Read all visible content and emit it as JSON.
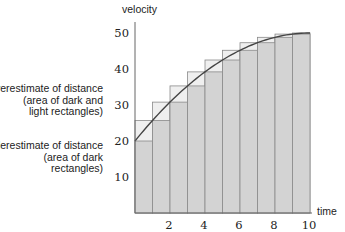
{
  "chart_data": {
    "type": "bar",
    "subtype": "riemann-sum",
    "title": "",
    "xlabel": "time",
    "ylabel": "velocity",
    "xlim": [
      0,
      10
    ],
    "ylim": [
      0,
      52
    ],
    "x_ticks": [
      2,
      4,
      6,
      8,
      10
    ],
    "y_ticks": [
      10,
      20,
      30,
      40,
      50
    ],
    "grid": false,
    "categories": [
      "0-1",
      "1-2",
      "2-3",
      "3-4",
      "4-5",
      "5-6",
      "6-7",
      "7-8",
      "8-9",
      "9-10"
    ],
    "series": [
      {
        "name": "Underestimate (dark rectangles, left endpoints)",
        "values": [
          20,
          25.7,
          30.8,
          35.3,
          39.2,
          42.5,
          45.2,
          47.3,
          48.8,
          49.7
        ]
      },
      {
        "name": "Overestimate (dark + light rectangles, right endpoints)",
        "values": [
          25.7,
          30.8,
          35.3,
          39.2,
          42.5,
          45.2,
          47.3,
          48.8,
          49.7,
          50
        ]
      }
    ],
    "curve": {
      "name": "velocity",
      "x": [
        0,
        1,
        2,
        3,
        4,
        5,
        6,
        7,
        8,
        9,
        10
      ],
      "y": [
        20,
        25.7,
        30.8,
        35.3,
        39.2,
        42.5,
        45.2,
        47.3,
        48.8,
        49.7,
        50
      ]
    },
    "annotations": [
      {
        "lines": [
          "Overestimate of distance",
          "(area of dark and",
          "light rectangles)"
        ]
      },
      {
        "lines": [
          "Underestimate of distance",
          "(area of dark",
          "rectangles)"
        ]
      }
    ],
    "colors": {
      "dark_fill": "#d3d3d3",
      "light_fill": "#efefef",
      "edge": "#8a8a8a",
      "curve": "#444444",
      "axis": "#666666"
    }
  }
}
